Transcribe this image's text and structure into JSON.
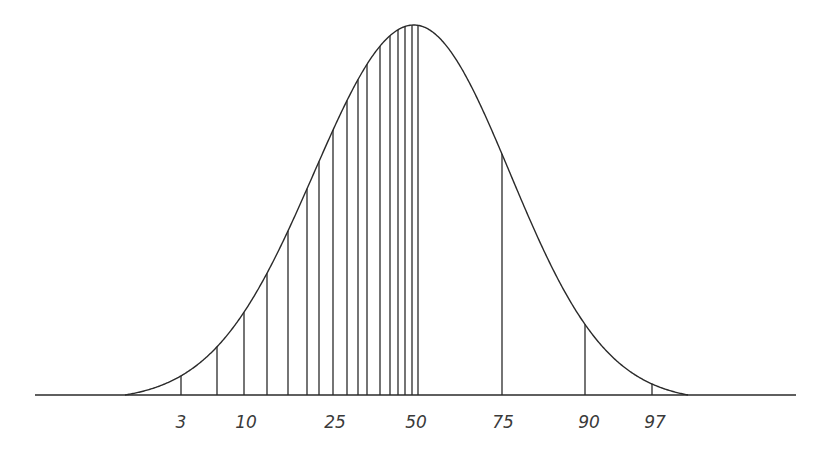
{
  "diagram": {
    "stroke_color": "#2a2a2a",
    "label_color": "#3a3a3a",
    "baseline": {
      "x1": 35,
      "x2": 796,
      "y": 395
    },
    "curve": {
      "peak_x": 414,
      "peak_y": 25,
      "sigma_left": 100,
      "sigma_right": 96,
      "start_x": 125,
      "end_x": 688
    },
    "percentile_lines": [
      {
        "percentile": 3,
        "x": 181
      },
      {
        "percentile": 5,
        "x": 217
      },
      {
        "percentile": 10,
        "x": 244
      },
      {
        "percentile": 15,
        "x": 267
      },
      {
        "percentile": 20,
        "x": 288
      },
      {
        "percentile": 25,
        "x": 307
      },
      {
        "percentile": 28,
        "x": 319
      },
      {
        "percentile": 31,
        "x": 333
      },
      {
        "percentile": 35,
        "x": 347
      },
      {
        "percentile": 38,
        "x": 358
      },
      {
        "percentile": 40,
        "x": 367
      },
      {
        "percentile": 43,
        "x": 380
      },
      {
        "percentile": 45,
        "x": 390
      },
      {
        "percentile": 46,
        "x": 398
      },
      {
        "percentile": 47,
        "x": 405
      },
      {
        "percentile": 49,
        "x": 412
      },
      {
        "percentile": 50,
        "x": 418
      },
      {
        "percentile": 75,
        "x": 502
      },
      {
        "percentile": 90,
        "x": 585
      },
      {
        "percentile": 97,
        "x": 652
      }
    ],
    "labels": [
      {
        "text": "3",
        "x": 181,
        "y": 428
      },
      {
        "text": "10",
        "x": 246,
        "y": 428
      },
      {
        "text": "25",
        "x": 335,
        "y": 428
      },
      {
        "text": "50",
        "x": 416,
        "y": 428
      },
      {
        "text": "75",
        "x": 503,
        "y": 428
      },
      {
        "text": "90",
        "x": 589,
        "y": 428
      },
      {
        "text": "97",
        "x": 655,
        "y": 428
      }
    ]
  }
}
